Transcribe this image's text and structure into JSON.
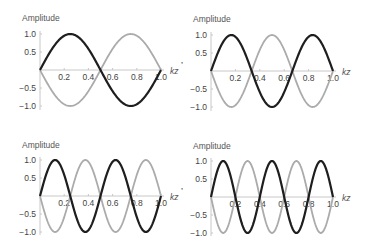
{
  "chart_data": [
    {
      "type": "line",
      "title": "",
      "xlabel": "kz",
      "ylabel": "Amplitude",
      "xlim": [
        0,
        1.0
      ],
      "ylim": [
        -1.0,
        1.0
      ],
      "xticks": [
        "0.2",
        "0.4",
        "0.6",
        "0.8",
        "1.0"
      ],
      "yticks": [
        "1.0",
        "0.5",
        "-0.5",
        "-1.0"
      ],
      "grid": false,
      "trailing_mark": ",",
      "mode_number": 2,
      "series": [
        {
          "name": "dark",
          "color": "#1e1e1e",
          "function": "sin(2*pi*kz)",
          "x": [
            0,
            0.125,
            0.25,
            0.375,
            0.5,
            0.625,
            0.75,
            0.875,
            1.0
          ],
          "values": [
            0,
            0.71,
            1.0,
            0.71,
            0,
            -0.71,
            -1.0,
            -0.71,
            0
          ]
        },
        {
          "name": "light",
          "color": "#ababab",
          "function": "-sin(2*pi*kz)",
          "x": [
            0,
            0.125,
            0.25,
            0.375,
            0.5,
            0.625,
            0.75,
            0.875,
            1.0
          ],
          "values": [
            0,
            -0.71,
            -1.0,
            -0.71,
            0,
            0.71,
            1.0,
            0.71,
            0
          ]
        }
      ]
    },
    {
      "type": "line",
      "title": "",
      "xlabel": "kz",
      "ylabel": "Amplitude",
      "xlim": [
        0,
        1.0
      ],
      "ylim": [
        -1.0,
        1.0
      ],
      "xticks": [
        "0.2",
        "0.4",
        "0.6",
        "0.8",
        "1.0"
      ],
      "yticks": [
        "1.0",
        "0.5",
        "-0.5",
        "-1.0"
      ],
      "grid": false,
      "trailing_mark": "",
      "mode_number": 3,
      "series": [
        {
          "name": "dark",
          "color": "#1e1e1e",
          "function": "sin(3*pi*kz)",
          "x": [
            0,
            0.1667,
            0.3333,
            0.5,
            0.6667,
            0.8333,
            1.0
          ],
          "values": [
            0,
            1.0,
            0,
            -1.0,
            0,
            1.0,
            0
          ]
        },
        {
          "name": "light",
          "color": "#ababab",
          "function": "-sin(3*pi*kz)",
          "x": [
            0,
            0.1667,
            0.3333,
            0.5,
            0.6667,
            0.8333,
            1.0
          ],
          "values": [
            0,
            -1.0,
            0,
            1.0,
            0,
            -1.0,
            0
          ]
        }
      ]
    },
    {
      "type": "line",
      "title": "",
      "xlabel": "kz",
      "ylabel": "Amplitude",
      "xlim": [
        0,
        1.0
      ],
      "ylim": [
        -1.0,
        1.0
      ],
      "xticks": [
        "0.2",
        "0.4",
        "0.6",
        "0.8",
        "1.0"
      ],
      "yticks": [
        "1.0",
        "0.5",
        "-0.5",
        "-1.0"
      ],
      "grid": false,
      "trailing_mark": ",",
      "mode_number": 4,
      "series": [
        {
          "name": "dark",
          "color": "#1e1e1e",
          "function": "sin(4*pi*kz)",
          "x": [
            0,
            0.125,
            0.25,
            0.375,
            0.5,
            0.625,
            0.75,
            0.875,
            1.0
          ],
          "values": [
            0,
            1.0,
            0,
            -1.0,
            0,
            1.0,
            0,
            -1.0,
            0
          ]
        },
        {
          "name": "light",
          "color": "#ababab",
          "function": "-sin(4*pi*kz)",
          "x": [
            0,
            0.125,
            0.25,
            0.375,
            0.5,
            0.625,
            0.75,
            0.875,
            1.0
          ],
          "values": [
            0,
            -1.0,
            0,
            1.0,
            0,
            -1.0,
            0,
            1.0,
            0
          ]
        }
      ]
    },
    {
      "type": "line",
      "title": "",
      "xlabel": "kz",
      "ylabel": "Amplitude",
      "xlim": [
        0,
        1.0
      ],
      "ylim": [
        -1.0,
        1.0
      ],
      "xticks": [
        "0.2",
        "0.4",
        "0.6",
        "0.8",
        "1.0"
      ],
      "yticks": [
        "1.0",
        "0.5",
        "-0.5",
        "-1.0"
      ],
      "grid": false,
      "trailing_mark": "",
      "mode_number": 5,
      "series": [
        {
          "name": "dark",
          "color": "#1e1e1e",
          "function": "sin(5*pi*kz)",
          "x": [
            0,
            0.1,
            0.2,
            0.3,
            0.4,
            0.5,
            0.6,
            0.7,
            0.8,
            0.9,
            1.0
          ],
          "values": [
            0,
            1.0,
            0,
            -1.0,
            0,
            1.0,
            0,
            -1.0,
            0,
            1.0,
            0
          ]
        },
        {
          "name": "light",
          "color": "#ababab",
          "function": "-sin(5*pi*kz)",
          "x": [
            0,
            0.1,
            0.2,
            0.3,
            0.4,
            0.5,
            0.6,
            0.7,
            0.8,
            0.9,
            1.0
          ],
          "values": [
            0,
            -1.0,
            0,
            1.0,
            0,
            -1.0,
            0,
            1.0,
            0,
            -1.0,
            0
          ]
        }
      ]
    }
  ],
  "layout": {
    "panels": [
      {
        "x0": 40,
        "x1": 161,
        "ytop": 34,
        "yzero": 70,
        "ybot": 107,
        "title_y": 21
      },
      {
        "x0": 211,
        "x1": 333,
        "ytop": 35,
        "yzero": 71,
        "ybot": 108,
        "title_y": 22
      },
      {
        "x0": 40,
        "x1": 161,
        "ytop": 160,
        "yzero": 196,
        "ybot": 232,
        "title_y": 148
      },
      {
        "x0": 211,
        "x1": 333,
        "ytop": 161,
        "yzero": 197,
        "ybot": 233,
        "title_y": 149
      }
    ],
    "colors": {
      "axis": "#c8c8c8",
      "tick_text": "#444444",
      "label_text": "#555555"
    }
  }
}
